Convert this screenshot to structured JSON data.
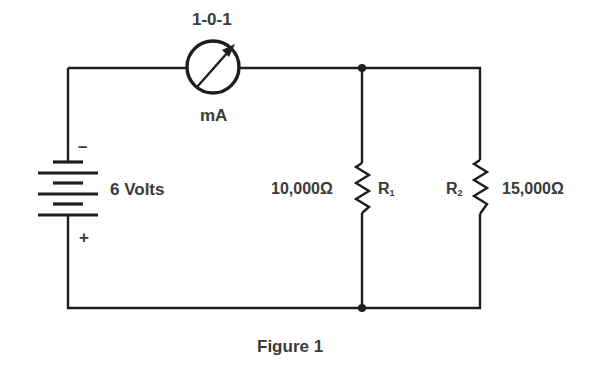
{
  "figure": {
    "caption": "Figure 1",
    "type": "circuit-schematic"
  },
  "meter": {
    "range_label": "1-0-1",
    "unit_label": "mA",
    "icon": "ammeter-icon"
  },
  "battery": {
    "voltage_label": "6 Volts",
    "negative_terminal": "–",
    "positive_terminal": "+",
    "icon": "battery-icon"
  },
  "resistors": [
    {
      "name": "R",
      "subscript": "1",
      "value_label": "10,000Ω"
    },
    {
      "name": "R",
      "subscript": "2",
      "value_label": "15,000Ω"
    }
  ],
  "colors": {
    "line": "#1e1e1e",
    "text": "#3a3a3a",
    "background": "#ffffff"
  }
}
